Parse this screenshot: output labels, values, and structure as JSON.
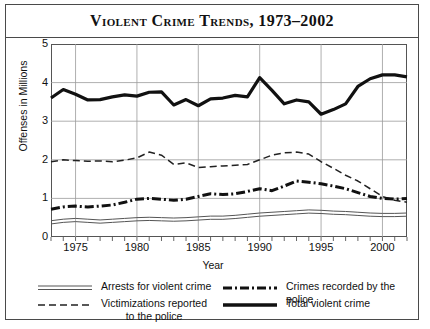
{
  "figure": {
    "title": "Violent Crime Trends, 1973–2002"
  },
  "chart_data": {
    "type": "line",
    "title": "Violent Crime Trends, 1973–2002",
    "xlabel": "Year",
    "ylabel": "Offenses in Millions",
    "xlim": [
      1973,
      2002
    ],
    "ylim": [
      0,
      5
    ],
    "ytick_labels": [
      "0",
      "1",
      "2",
      "3",
      "4",
      "5"
    ],
    "ytick_values": [
      0,
      1,
      2,
      3,
      4,
      5
    ],
    "xtick_labels": [
      "1975",
      "1980",
      "1985",
      "1990",
      "1995",
      "2000"
    ],
    "xtick_values": [
      1975,
      1980,
      1985,
      1990,
      1995,
      2000
    ],
    "grid": true,
    "legend_position": "below-axes",
    "x": [
      1973,
      1974,
      1975,
      1976,
      1977,
      1978,
      1979,
      1980,
      1981,
      1982,
      1983,
      1984,
      1985,
      1986,
      1987,
      1988,
      1989,
      1990,
      1991,
      1992,
      1993,
      1994,
      1995,
      1996,
      1997,
      1998,
      1999,
      2000,
      2001,
      2002
    ],
    "series": [
      {
        "name": "Total violent crime",
        "style": "solid-thick",
        "values": [
          3.6,
          3.82,
          3.7,
          3.55,
          3.56,
          3.63,
          3.68,
          3.65,
          3.75,
          3.76,
          3.42,
          3.56,
          3.4,
          3.58,
          3.6,
          3.67,
          3.63,
          4.13,
          3.8,
          3.45,
          3.55,
          3.5,
          3.18,
          3.3,
          3.45,
          3.9,
          4.1,
          4.2,
          4.2,
          4.15
        ]
      },
      {
        "name": "Victimizations reported to the police",
        "style": "dashed",
        "values": [
          1.95,
          2.0,
          1.98,
          1.96,
          1.97,
          1.95,
          1.99,
          2.05,
          2.2,
          2.12,
          1.88,
          1.92,
          1.8,
          1.82,
          1.84,
          1.86,
          1.88,
          2.0,
          2.12,
          2.18,
          2.2,
          2.15,
          1.95,
          1.78,
          1.6,
          1.45,
          1.25,
          1.05,
          0.95,
          0.9
        ]
      },
      {
        "name": "Crimes recorded by the police",
        "style": "dash-dot-thick",
        "values": [
          0.72,
          0.78,
          0.8,
          0.78,
          0.8,
          0.83,
          0.9,
          0.98,
          1.0,
          0.98,
          0.95,
          0.98,
          1.05,
          1.12,
          1.1,
          1.12,
          1.18,
          1.25,
          1.2,
          1.32,
          1.45,
          1.42,
          1.38,
          1.32,
          1.25,
          1.15,
          1.05,
          1.0,
          0.98,
          1.0
        ]
      },
      {
        "name": "Arrests for violent crime",
        "style": "double-thin",
        "values": [
          0.38,
          0.42,
          0.44,
          0.42,
          0.4,
          0.42,
          0.44,
          0.46,
          0.47,
          0.46,
          0.45,
          0.46,
          0.48,
          0.5,
          0.5,
          0.52,
          0.55,
          0.58,
          0.6,
          0.62,
          0.64,
          0.66,
          0.65,
          0.63,
          0.62,
          0.6,
          0.58,
          0.57,
          0.57,
          0.58
        ]
      }
    ]
  },
  "legend": {
    "items": [
      {
        "label": "Arrests for violent crime",
        "label2": "",
        "key": "double-thin"
      },
      {
        "label": "Victimizations reported",
        "label2": "to the police",
        "key": "dashed"
      },
      {
        "label": "Crimes recorded by the police",
        "label2": "",
        "key": "dash-dot-thick"
      },
      {
        "label": "Total violent crime",
        "label2": "",
        "key": "solid-thick"
      }
    ]
  }
}
